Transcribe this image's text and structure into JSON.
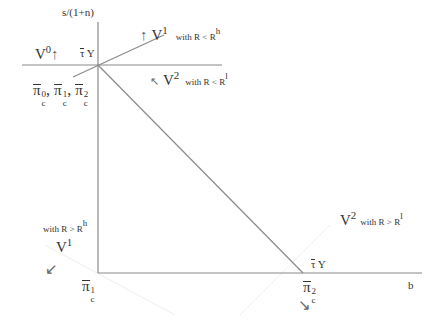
{
  "axes": {
    "y_label": "s/(1+n)",
    "x_label": "b",
    "upper_line_label": "τ̄ Y",
    "lower_axis_label": "τ̄ Y"
  },
  "intersection_label": {
    "sym": "π",
    "sub": "c",
    "sups": [
      "0",
      "1",
      "2"
    ]
  },
  "pi_c1": {
    "sym": "π",
    "sub": "c",
    "sup": "1"
  },
  "pi_c2": {
    "sym": "π",
    "sub": "c",
    "sup": "2"
  },
  "regions": {
    "v0": {
      "name": "V",
      "sup": "0",
      "arrow": "↑"
    },
    "v1_low": {
      "name": "V",
      "sup": "1",
      "cond": "with  R < R",
      "cond_sup": "h",
      "arrow": "↑"
    },
    "v2_low": {
      "name": "V",
      "sup": "2",
      "cond": "with  R < R",
      "cond_sup": "l",
      "arrow": "↗"
    },
    "v1_high": {
      "name": "V",
      "sup": "1",
      "cond": "with  R > R",
      "cond_sup": "h",
      "arrow": "↙"
    },
    "v2_high": {
      "name": "V",
      "sup": "2",
      "cond": "with  R > R",
      "cond_sup": "l",
      "arrow": "↘"
    }
  },
  "colors": {
    "line": "#8a8a8a",
    "faint": "#ececec",
    "text": "#333333"
  }
}
